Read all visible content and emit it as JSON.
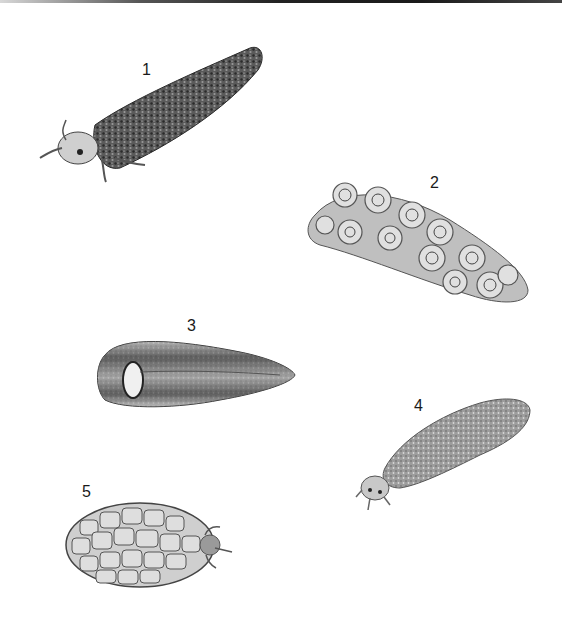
{
  "figure": {
    "colors": {
      "background": "#ffffff",
      "ink": "#1a1a1a",
      "top_bar": "#222222"
    },
    "specimens": [
      {
        "number": "1",
        "label_pos": [
          142,
          62
        ],
        "description": "elongated curved case of coarse sand grains with larva head and legs emerging"
      },
      {
        "number": "2",
        "label_pos": [
          430,
          175
        ],
        "description": "case built of small spiral snail shells"
      },
      {
        "number": "3",
        "label_pos": [
          187,
          318
        ],
        "description": "tapered conical case, opening on left"
      },
      {
        "number": "4",
        "label_pos": [
          414,
          398
        ],
        "description": "cylindrical fine sand case with larva emerging at lower left"
      },
      {
        "number": "5",
        "label_pos": [
          82,
          484
        ],
        "description": "oval case of flat mosaic stones with larva emerging on right"
      }
    ]
  }
}
